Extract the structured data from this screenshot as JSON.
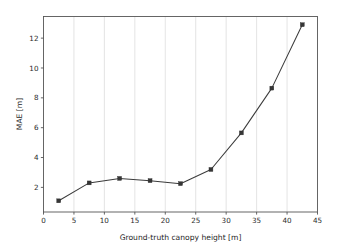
{
  "chart_data": {
    "type": "line",
    "title": "",
    "subtitle": "",
    "xlabel": "Ground-truth canopy height [m]",
    "ylabel": "MAE [m]",
    "x": [
      2.5,
      7.5,
      12.5,
      17.5,
      22.5,
      27.5,
      32.5,
      37.5,
      42.5
    ],
    "values": [
      1.1,
      2.3,
      2.6,
      2.45,
      2.25,
      3.2,
      5.65,
      8.65,
      12.9
    ],
    "series": [
      {
        "name": "MAE",
        "values": [
          1.1,
          2.3,
          2.6,
          2.45,
          2.25,
          3.2,
          5.65,
          8.65,
          12.9
        ]
      }
    ],
    "xlim": [
      0,
      45
    ],
    "ylim": [
      0.35,
      13.45
    ],
    "xticks": [
      0,
      5,
      10,
      15,
      20,
      25,
      30,
      35,
      40,
      45
    ],
    "xticklabels": [
      "0",
      "5",
      "10",
      "15",
      "20",
      "25",
      "30",
      "35",
      "40",
      "45"
    ],
    "yticks": [
      2,
      4,
      6,
      8,
      10,
      12
    ],
    "yticklabels": [
      "2",
      "4",
      "6",
      "8",
      "10",
      "12"
    ],
    "grid": {
      "vertical": true,
      "horizontal": false,
      "color": "#d8d8d8"
    },
    "legend": {
      "visible": false,
      "position": "none",
      "entries": []
    },
    "annotations": [],
    "marker": "square",
    "line_color": "#3c3c3c",
    "marker_color": "#363636"
  }
}
